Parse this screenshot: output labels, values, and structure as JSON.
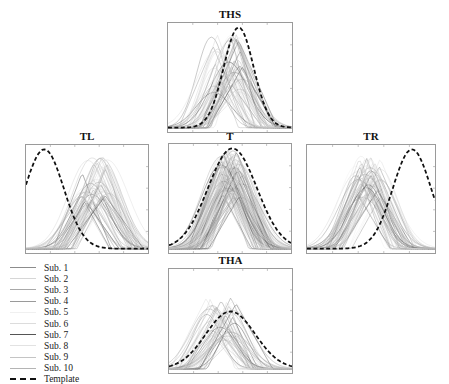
{
  "figure": {
    "panels": [
      {
        "id": "THS",
        "title": "THS",
        "box": [
          167,
          22,
          126,
          111
        ],
        "title_y": 9
      },
      {
        "id": "TL",
        "title": "TL",
        "box": [
          25,
          144,
          124,
          110
        ],
        "title_y": 131
      },
      {
        "id": "T",
        "title": "T",
        "box": [
          168,
          143,
          124,
          111
        ],
        "title_y": 131
      },
      {
        "id": "TR",
        "title": "TR",
        "box": [
          306,
          144,
          130,
          110
        ],
        "title_y": 131
      },
      {
        "id": "THA",
        "title": "THA",
        "box": [
          168,
          268,
          125,
          106
        ],
        "title_y": 255
      }
    ],
    "legend": {
      "items": [
        {
          "label": "Sub. 1",
          "color": "#8c8c8c",
          "style": "solid"
        },
        {
          "label": "Sub. 2",
          "color": "#d6d6d6",
          "style": "solid"
        },
        {
          "label": "Sub. 3",
          "color": "#a8a8a8",
          "style": "solid"
        },
        {
          "label": "Sub. 4",
          "color": "#9a9a9a",
          "style": "solid"
        },
        {
          "label": "Sub. 5",
          "color": "#f0f0f0",
          "style": "solid"
        },
        {
          "label": "Sub. 6",
          "color": "#dcdcdc",
          "style": "solid"
        },
        {
          "label": "Sub. 7",
          "color": "#555555",
          "style": "solid"
        },
        {
          "label": "Sub. 8",
          "color": "#e2e2e2",
          "style": "solid"
        },
        {
          "label": "Sub. 9",
          "color": "#c4c4c4",
          "style": "solid"
        },
        {
          "label": "Sub. 10",
          "color": "#b4b4b4",
          "style": "solid"
        },
        {
          "label": "Template",
          "color": "#111111",
          "style": "dashed"
        }
      ]
    }
  },
  "chart_data": [
    {
      "type": "line",
      "title": "THS",
      "xlabel": "",
      "ylabel": "",
      "xlim": [
        0,
        1
      ],
      "ylim": [
        0,
        1
      ],
      "grid": false,
      "template": {
        "center": 0.57,
        "width": 0.12,
        "peak": 1.0
      },
      "subjects": {
        "count": 60,
        "center_range": [
          0.35,
          0.6
        ],
        "peak_range": [
          0.35,
          0.95
        ],
        "width_range": [
          0.18,
          0.3
        ]
      }
    },
    {
      "type": "line",
      "title": "TL",
      "xlabel": "",
      "ylabel": "",
      "xlim": [
        0,
        1
      ],
      "ylim": [
        0,
        1
      ],
      "grid": false,
      "template": {
        "center": 0.15,
        "width": 0.16,
        "peak": 1.0
      },
      "subjects": {
        "count": 60,
        "center_range": [
          0.45,
          0.68
        ],
        "peak_range": [
          0.45,
          0.96
        ],
        "width_range": [
          0.2,
          0.32
        ]
      }
    },
    {
      "type": "line",
      "title": "T",
      "xlabel": "",
      "ylabel": "",
      "xlim": [
        0,
        1
      ],
      "ylim": [
        0,
        1
      ],
      "grid": false,
      "template": {
        "center": 0.52,
        "width": 0.2,
        "peak": 1.0
      },
      "subjects": {
        "count": 120,
        "center_range": [
          0.42,
          0.6
        ],
        "peak_range": [
          0.5,
          1.0
        ],
        "width_range": [
          0.22,
          0.3
        ]
      }
    },
    {
      "type": "line",
      "title": "TR",
      "xlabel": "",
      "ylabel": "",
      "xlim": [
        0,
        1
      ],
      "ylim": [
        0,
        1
      ],
      "grid": false,
      "template": {
        "center": 0.82,
        "width": 0.15,
        "peak": 1.0
      },
      "subjects": {
        "count": 60,
        "center_range": [
          0.38,
          0.58
        ],
        "peak_range": [
          0.5,
          0.95
        ],
        "width_range": [
          0.2,
          0.3
        ]
      }
    },
    {
      "type": "line",
      "title": "THA",
      "xlabel": "",
      "ylabel": "",
      "xlim": [
        0,
        1
      ],
      "ylim": [
        0,
        1
      ],
      "grid": false,
      "template": {
        "center": 0.5,
        "width": 0.2,
        "peak": 0.6
      },
      "subjects": {
        "count": 50,
        "center_range": [
          0.3,
          0.55
        ],
        "peak_range": [
          0.3,
          0.75
        ],
        "width_range": [
          0.18,
          0.3
        ]
      }
    }
  ]
}
